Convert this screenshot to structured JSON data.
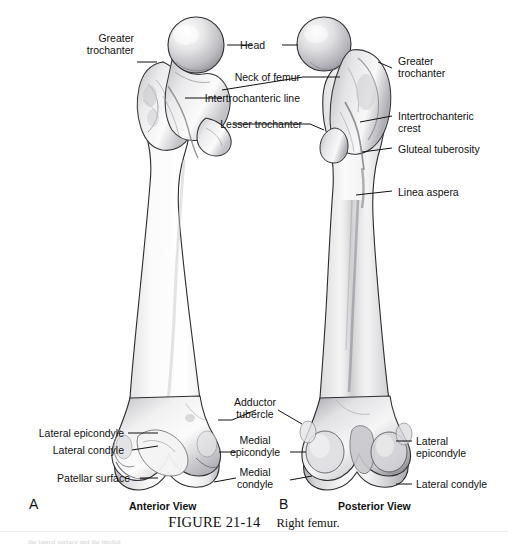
{
  "figure": {
    "caption_number": "FIGURE 21-14",
    "caption_text": "Right femur.",
    "bleed_text": "the lateral surface and the medial"
  },
  "panels": [
    {
      "letter": "A",
      "view_name": "Anterior View"
    },
    {
      "letter": "B",
      "view_name": "Posterior View"
    }
  ],
  "labels": {
    "greater_trochanter_left": "Greater\ntrochanter",
    "head": "Head",
    "greater_trochanter_right": "Greater\ntrochanter",
    "neck_of_femur": "Neck of femur",
    "intertrochanteric_line": "Intertrochanteric line",
    "intertrochanteric_crest": "Intertrochanteric\ncrest",
    "lesser_trochanter": "Lesser trochanter",
    "gluteal_tuberosity": "Gluteal tuberosity",
    "linea_aspera": "Linea aspera",
    "lateral_epicondyle_left": "Lateral epicondyle",
    "lateral_condyle_left": "Lateral condyle",
    "patellar_surface": "Patellar surface",
    "adductor_tubercle": "Adductor\ntubercle",
    "medial_epicondyle": "Medial\nepicondyle",
    "medial_condyle": "Medial\ncondyle",
    "lateral_epicondyle_right": "Lateral\nepicondyle",
    "lateral_condyle_right": "Lateral condyle"
  },
  "colors": {
    "bone_light": "#fbfbfb",
    "bone_mid": "#d5d5d7",
    "bone_shadow": "#9a9a9e",
    "bone_dark": "#6f6f74",
    "outline": "#2a2a2c",
    "leader": "#111111",
    "text": "#111111",
    "background": "#ffffff"
  }
}
